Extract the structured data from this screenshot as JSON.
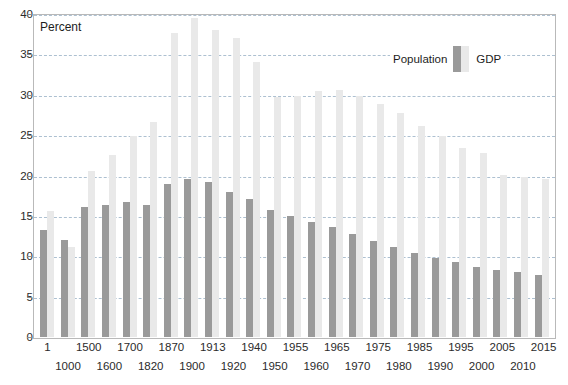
{
  "chart_data": {
    "type": "bar",
    "title": "",
    "subtitle": "",
    "axis_title": "Percent",
    "xlabel": "",
    "ylabel": "Percent",
    "ylim": [
      0,
      40
    ],
    "ytick_values": [
      0,
      5,
      10,
      15,
      20,
      25,
      30,
      35,
      40
    ],
    "ytick_labels": [
      "0",
      "5",
      "10",
      "15",
      "20",
      "25",
      "30",
      "35",
      "40"
    ],
    "grid": true,
    "legend_position": "top-right",
    "categories": [
      "1",
      "1000",
      "1500",
      "1600",
      "1700",
      "1820",
      "1870",
      "1900",
      "1913",
      "1920",
      "1940",
      "1950",
      "1955",
      "1960",
      "1965",
      "1970",
      "1975",
      "1980",
      "1985",
      "1990",
      "1995",
      "2000",
      "2005",
      "2010",
      "2015"
    ],
    "series": [
      {
        "name": "Population",
        "color": "#9a9a9a",
        "values": [
          13.2,
          12.0,
          16.1,
          16.3,
          16.7,
          16.4,
          19.0,
          19.6,
          19.2,
          18.0,
          17.1,
          15.7,
          15.0,
          14.2,
          13.6,
          12.7,
          11.9,
          11.1,
          10.4,
          9.8,
          9.3,
          8.7,
          8.3,
          8.0,
          7.7
        ]
      },
      {
        "name": "GDP",
        "color": "#e9e9e9",
        "values": [
          15.6,
          11.2,
          20.5,
          22.6,
          24.9,
          26.6,
          37.6,
          39.5,
          38.0,
          37.0,
          34.0,
          29.7,
          29.9,
          30.5,
          30.6,
          29.8,
          28.9,
          27.8,
          26.1,
          24.9,
          23.4,
          22.8,
          20.1,
          19.8,
          19.6
        ]
      }
    ],
    "xtick_rows": [
      [
        "1",
        "",
        "1500",
        "",
        "1700",
        "",
        "1870",
        "",
        "1913",
        "",
        "1940",
        "",
        "1955",
        "",
        "1965",
        "",
        "1975",
        "",
        "1985",
        "",
        "1995",
        "",
        "2005",
        "",
        "2015"
      ],
      [
        "",
        "1000",
        "",
        "1600",
        "",
        "1820",
        "",
        "1900",
        "",
        "1920",
        "",
        "1950",
        "",
        "1960",
        "",
        "1970",
        "",
        "1980",
        "",
        "1990",
        "",
        "2000",
        "",
        "2010",
        ""
      ]
    ]
  },
  "legend": {
    "population_label": "Population",
    "gdp_label": "GDP"
  }
}
